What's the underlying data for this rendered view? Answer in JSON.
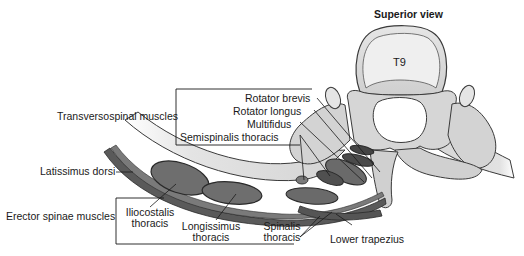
{
  "figure": {
    "title": "Superior view",
    "vertebra_label": "T9",
    "caption_visible_fragment": "FIG 34 Cross-sectional view through T9 (partially cut off)"
  },
  "labels": {
    "transversospinal_group": "Transversospinal muscles",
    "rotator_brevis": "Rotator brevis",
    "rotator_longus": "Rotator longus",
    "multifidus": "Multifidus",
    "semispinalis_thoracis": "Semispinalis thoracis",
    "latissimus_dorsi": "Latissimus dorsi",
    "erector_spinae_group": "Erector spinae muscles",
    "iliocostalis_1": "Iliocostalis",
    "iliocostalis_2": "thoracis",
    "longissimus_1": "Longissimus",
    "longissimus_2": "thoracis",
    "spinalis_1": "Spinalis",
    "spinalis_2": "thoracis",
    "lower_trapezius": "Lower trapezius"
  },
  "colors": {
    "bone_fill": "#d9d9d9",
    "bone_light": "#ececec",
    "bone_stroke": "#3a3a3a",
    "muscle_dark": "#555555",
    "muscle_mid": "#7a7a7a",
    "line": "#1a1a1a"
  }
}
